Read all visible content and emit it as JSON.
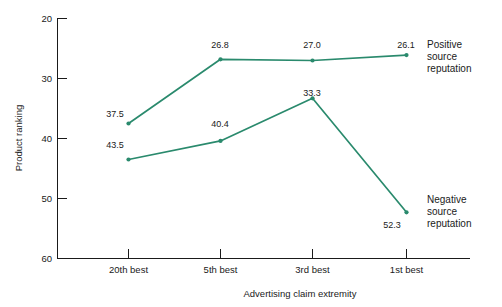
{
  "chart_data": {
    "type": "line",
    "title": "",
    "xlabel": "Advertising claim extremity",
    "ylabel": "Product ranking",
    "categories": [
      "20th best",
      "5th best",
      "3rd best",
      "1st best"
    ],
    "ylim": [
      20,
      60
    ],
    "y_inverted": true,
    "yticks": [
      "20",
      "30",
      "40",
      "50",
      "60"
    ],
    "grid": false,
    "legend_position": "right-of-plot",
    "series": [
      {
        "name": "Positive source reputation",
        "color": "#2a8a6d",
        "values": [
          37.5,
          26.8,
          27.0,
          26.1
        ],
        "point_labels": [
          "37.5",
          "26.8",
          "27.0",
          "26.1"
        ]
      },
      {
        "name": "Negative source reputation",
        "color": "#2a8a6d",
        "values": [
          43.5,
          40.4,
          33.3,
          52.3
        ],
        "point_labels": [
          "43.5",
          "40.4",
          "33.3",
          "52.3"
        ]
      }
    ]
  },
  "axes": {
    "y_title": "Product ranking",
    "x_title": "Advertising claim extremity",
    "y_ticks": {
      "t0": "20",
      "t1": "30",
      "t2": "40",
      "t3": "50",
      "t4": "60"
    },
    "x_ticks": {
      "t0": "20th best",
      "t1": "5th best",
      "t2": "3rd best",
      "t3": "1st best"
    }
  },
  "series_positive": {
    "legend_line1": "Positive",
    "legend_line2": "source",
    "legend_line3": "reputation",
    "p0": "37.5",
    "p1": "26.8",
    "p2": "27.0",
    "p3": "26.1"
  },
  "series_negative": {
    "legend_line1": "Negative",
    "legend_line2": "source",
    "legend_line3": "reputation",
    "p0": "43.5",
    "p1": "40.4",
    "p2": "33.3",
    "p3": "52.3"
  },
  "colors": {
    "line": "#2a8a6d",
    "axis": "#1a1a1a",
    "background": "#ffffff"
  }
}
